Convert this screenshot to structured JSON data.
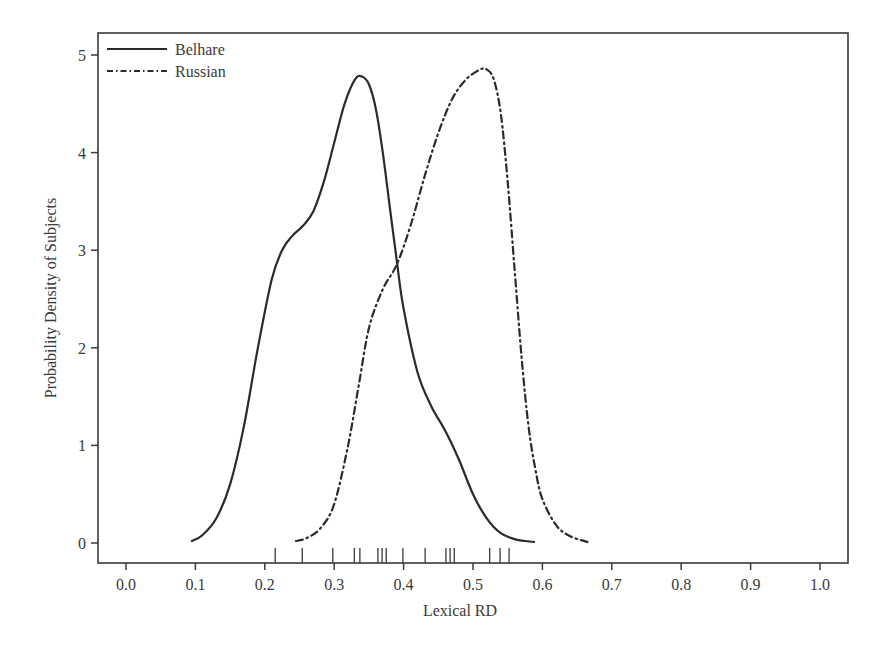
{
  "chart_data": {
    "type": "line",
    "subtype": "kernel-density-with-rug",
    "title": "",
    "xlabel": "Lexical RD",
    "ylabel": "Probability Density of Subjects",
    "xlim": [
      -0.03,
      1.03
    ],
    "ylim": [
      -0.2,
      5.2
    ],
    "xticks": [
      0.0,
      0.1,
      0.2,
      0.3,
      0.4,
      0.5,
      0.6,
      0.7,
      0.8,
      0.9,
      1.0
    ],
    "xtick_labels": [
      "0.0",
      "0.1",
      "0.2",
      "0.3",
      "0.4",
      "0.5",
      "0.6",
      "0.7",
      "0.8",
      "0.9",
      "1.0"
    ],
    "yticks": [
      0,
      1,
      2,
      3,
      4,
      5
    ],
    "ytick_labels": [
      "0",
      "1",
      "2",
      "3",
      "4",
      "5"
    ],
    "grid": false,
    "legend_position": "top-left",
    "series": [
      {
        "name": "Belhare",
        "style": "solid",
        "color": "#2b2b2b",
        "x": [
          0.095,
          0.11,
          0.13,
          0.15,
          0.17,
          0.19,
          0.21,
          0.225,
          0.24,
          0.255,
          0.27,
          0.285,
          0.3,
          0.315,
          0.33,
          0.34,
          0.35,
          0.36,
          0.37,
          0.38,
          0.39,
          0.4,
          0.42,
          0.44,
          0.46,
          0.48,
          0.5,
          0.52,
          0.54,
          0.56,
          0.575,
          0.588
        ],
        "y": [
          0.02,
          0.08,
          0.25,
          0.6,
          1.2,
          2.0,
          2.7,
          3.0,
          3.15,
          3.25,
          3.4,
          3.7,
          4.1,
          4.5,
          4.75,
          4.78,
          4.7,
          4.45,
          4.0,
          3.45,
          2.9,
          2.4,
          1.75,
          1.4,
          1.15,
          0.85,
          0.5,
          0.25,
          0.1,
          0.04,
          0.02,
          0.01
        ]
      },
      {
        "name": "Russian",
        "style": "dashdot",
        "color": "#2b2b2b",
        "x": [
          0.245,
          0.26,
          0.28,
          0.3,
          0.32,
          0.335,
          0.35,
          0.37,
          0.39,
          0.41,
          0.43,
          0.45,
          0.47,
          0.49,
          0.51,
          0.52,
          0.53,
          0.54,
          0.55,
          0.56,
          0.57,
          0.58,
          0.59,
          0.6,
          0.62,
          0.64,
          0.665
        ],
        "y": [
          0.02,
          0.05,
          0.15,
          0.4,
          1.0,
          1.6,
          2.2,
          2.6,
          2.85,
          3.25,
          3.75,
          4.2,
          4.55,
          4.75,
          4.85,
          4.85,
          4.75,
          4.4,
          3.7,
          2.8,
          1.9,
          1.2,
          0.75,
          0.45,
          0.18,
          0.07,
          0.01
        ]
      }
    ],
    "rug": [
      0.215,
      0.254,
      0.298,
      0.329,
      0.337,
      0.363,
      0.369,
      0.375,
      0.399,
      0.431,
      0.461,
      0.467,
      0.473,
      0.524,
      0.539,
      0.552
    ]
  }
}
